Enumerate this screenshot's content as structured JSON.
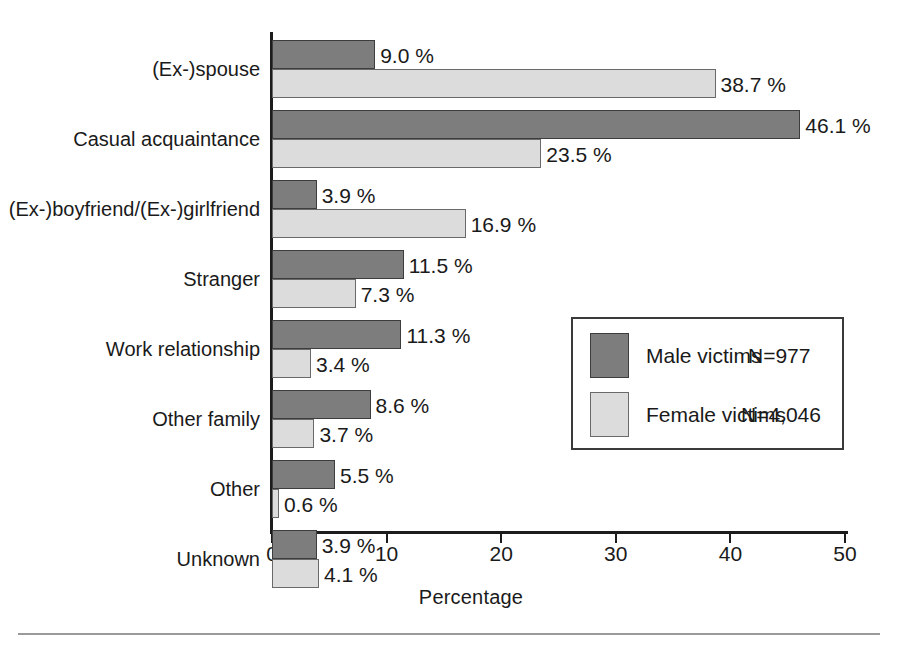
{
  "chart_data": {
    "type": "bar",
    "orientation": "horizontal",
    "title": "",
    "xlabel": "Percentage",
    "ylabel": "",
    "xlim": [
      0,
      50
    ],
    "xticks": [
      0,
      10,
      20,
      30,
      40,
      50
    ],
    "grid": false,
    "legend_position": "inside-right",
    "categories": [
      "(Ex-)spouse",
      "Casual acquaintance",
      "(Ex-)boyfriend/(Ex-)girlfriend",
      "Stranger",
      "Work relationship",
      "Other family",
      "Other",
      "Unknown"
    ],
    "series": [
      {
        "name": "Male victims",
        "n_label": "N=977",
        "color": "#7d7d7d",
        "values": [
          9.0,
          46.1,
          3.9,
          11.5,
          11.3,
          8.6,
          5.5,
          3.9
        ],
        "labels": [
          "9.0 %",
          "46.1 %",
          "3.9 %",
          "11.5 %",
          "11.3 %",
          "8.6 %",
          "5.5 %",
          "3.9 %"
        ]
      },
      {
        "name": "Female victims",
        "n_label": "N=4,046",
        "color": "#dcdcdc",
        "values": [
          38.7,
          23.5,
          16.9,
          7.3,
          3.4,
          3.7,
          0.6,
          4.1
        ],
        "labels": [
          "38.7 %",
          "23.5 %",
          "16.9 %",
          "7.3 %",
          "3.4 %",
          "3.7 %",
          "0.6 %",
          "4.1 %"
        ]
      }
    ]
  },
  "axis": {
    "tick_labels": [
      "0",
      "10",
      "20",
      "30",
      "40",
      "50"
    ],
    "x_title": "Percentage"
  },
  "legend": {
    "entries": [
      {
        "label": "Male victims",
        "n": "N=977"
      },
      {
        "label": "Female victims",
        "n": "N=4,046"
      }
    ]
  }
}
